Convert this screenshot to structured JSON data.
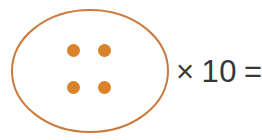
{
  "problem": {
    "type": "multiplication-group-model",
    "group": {
      "shape": "ellipse",
      "outline_color": "#cc7a3d",
      "fill_color": "#ffffff",
      "stroke_width": 2,
      "dot_count": 4,
      "dot_color": "#d9822b",
      "dot_arrangement": "2x2",
      "dot_radius": 6.5,
      "dots": [
        {
          "label": "dot-1",
          "cx": 73.5,
          "cy": 50.5
        },
        {
          "label": "dot-2",
          "cx": 104.5,
          "cy": 50.5
        },
        {
          "label": "dot-3",
          "cx": 73.5,
          "cy": 87.5
        },
        {
          "label": "dot-4",
          "cx": 104.5,
          "cy": 87.5
        }
      ],
      "ellipse": {
        "cx": 90,
        "cy": 71,
        "rx": 78,
        "ry": 61
      }
    },
    "equation": {
      "multiply_symbol": "×",
      "multiplier": "10",
      "equals_symbol": "=",
      "answer": "",
      "text_color": "#36373a",
      "full_text": "× 10 ="
    }
  }
}
